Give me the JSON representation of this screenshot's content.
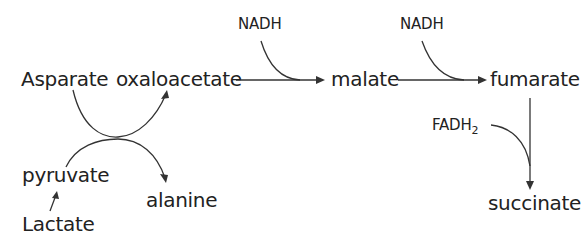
{
  "diagram": {
    "type": "metabolic-pathway",
    "colors": {
      "text": "#222222",
      "arrow": "#333333",
      "background": "#ffffff"
    },
    "nodes": {
      "asparate": "Asparate",
      "oxaloacetate": "oxaloacetate",
      "malate": "malate",
      "fumarate": "fumarate",
      "succinate": "succinate",
      "pyruvate": "pyruvate",
      "alanine": "alanine",
      "lactate": "Lactate"
    },
    "cofactors": {
      "nadh_1": "NADH",
      "nadh_2": "NADH",
      "fadh2_base": "FADH",
      "fadh2_sub": "2"
    },
    "edges": [
      {
        "from": "asparate",
        "to": "oxaloacetate",
        "style": "crossing-curve"
      },
      {
        "from": "pyruvate",
        "to": "alanine",
        "style": "crossing-curve"
      },
      {
        "from": "lactate",
        "to": "pyruvate"
      },
      {
        "from": "oxaloacetate",
        "to": "malate",
        "cofactor": "NADH"
      },
      {
        "from": "malate",
        "to": "fumarate",
        "cofactor": "NADH"
      },
      {
        "from": "fumarate",
        "to": "succinate",
        "cofactor": "FADH2"
      }
    ]
  }
}
